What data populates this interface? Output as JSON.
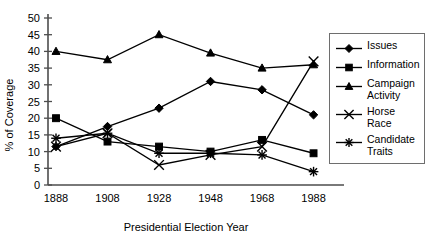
{
  "chart_data": {
    "type": "line",
    "title": "",
    "xlabel": "Presidential Election Year",
    "ylabel": "% of Coverage",
    "categories": [
      "1888",
      "1908",
      "1928",
      "1948",
      "1968",
      "1988"
    ],
    "x": [
      1888,
      1908,
      1928,
      1948,
      1968,
      1988
    ],
    "xlim": [
      1878,
      1998
    ],
    "ylim": [
      0,
      50
    ],
    "ytick_labels": [
      "0",
      "5",
      "10",
      "15",
      "20",
      "25",
      "30",
      "35",
      "40",
      "45",
      "50"
    ],
    "yticks": [
      0,
      5,
      10,
      15,
      20,
      25,
      30,
      35,
      40,
      45,
      50
    ],
    "grid": false,
    "legend_position": "right",
    "series": [
      {
        "name": "Issues",
        "marker": "diamond",
        "values": [
          11.5,
          17.5,
          23,
          31,
          28.5,
          21
        ]
      },
      {
        "name": "Information",
        "marker": "square",
        "values": [
          20,
          13,
          11.5,
          10,
          13.5,
          9.5
        ]
      },
      {
        "name": "Campaign Activity",
        "marker": "triangle",
        "values": [
          40,
          37.5,
          45,
          39.5,
          35,
          36
        ]
      },
      {
        "name": "Horse Race",
        "marker": "cross",
        "values": [
          11.5,
          15.5,
          6,
          9,
          11.5,
          37
        ]
      },
      {
        "name": "Candidate Traits",
        "marker": "asterisk",
        "values": [
          14,
          15.5,
          9.5,
          9.5,
          9,
          4
        ]
      }
    ]
  },
  "legend": {
    "items": [
      {
        "label": "Issues",
        "marker": "diamond"
      },
      {
        "label": "Information",
        "marker": "square"
      },
      {
        "label": "Campaign\nActivity",
        "marker": "triangle"
      },
      {
        "label": "Horse Race",
        "marker": "cross"
      },
      {
        "label": "Candidate\nTraits",
        "marker": "asterisk"
      }
    ]
  },
  "colors": {
    "line": "#000000",
    "axis": "#4d4d4d",
    "legend_border": "#6e6e6e",
    "background": "#ffffff"
  }
}
